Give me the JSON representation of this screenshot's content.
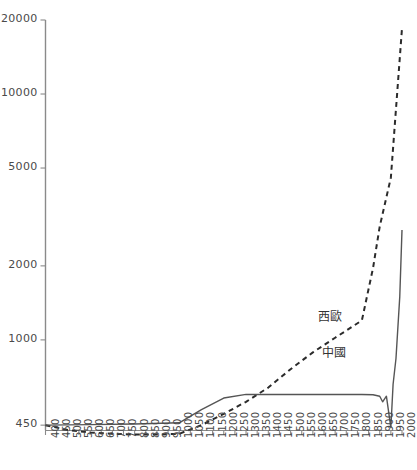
{
  "chart_data": {
    "type": "line",
    "title": "",
    "subtitle": "",
    "xlabel": "",
    "ylabel": "",
    "yscale": "log",
    "xlim": [
      400,
      2000
    ],
    "ylim": [
      430,
      20000
    ],
    "grid": false,
    "legend_position": "inline-annotations",
    "y_ticks": [
      {
        "value": 20000,
        "label": "20000"
      },
      {
        "value": 10000,
        "label": "10000"
      },
      {
        "value": 5000,
        "label": "5000"
      },
      {
        "value": 2000,
        "label": "2000"
      },
      {
        "value": 1000,
        "label": "1000"
      },
      {
        "value": 450,
        "label": "450"
      }
    ],
    "x_ticks": [
      "400",
      "450",
      "500",
      "550",
      "600",
      "650",
      "700",
      "750",
      "800",
      "850",
      "900",
      "950",
      "1000",
      "1050",
      "1100",
      "1150",
      "1200",
      "1250",
      "1300",
      "1350",
      "1400",
      "1450",
      "1500",
      "1550",
      "1600",
      "1650",
      "1700",
      "1750",
      "1800",
      "1850",
      "1900",
      "1950",
      "2000"
    ],
    "series": [
      {
        "name": "西歐",
        "label": "西歐",
        "style": "dashed",
        "color": "#2b2b2b",
        "label_position": {
          "x": 318,
          "y": 307
        },
        "x": [
          400,
          500,
          600,
          700,
          800,
          900,
          1000,
          1100,
          1200,
          1300,
          1400,
          1500,
          1600,
          1700,
          1820,
          1870,
          1900,
          1950,
          2000
        ],
        "values": [
          450,
          430,
          420,
          415,
          412,
          412,
          415,
          450,
          500,
          560,
          640,
          760,
          890,
          1020,
          1200,
          1960,
          2890,
          4570,
          18500
        ]
      },
      {
        "name": "中國",
        "label": "中國",
        "style": "solid",
        "color": "#555555",
        "label_position": {
          "x": 322,
          "y": 343
        },
        "x": [
          400,
          600,
          800,
          1000,
          1100,
          1200,
          1300,
          1400,
          1500,
          1600,
          1700,
          1820,
          1870,
          1900,
          1913,
          1930,
          1950,
          1960,
          1973,
          1990,
          2000
        ],
        "values": [
          450,
          452,
          455,
          460,
          520,
          580,
          600,
          600,
          600,
          600,
          600,
          600,
          598,
          590,
          560,
          590,
          440,
          660,
          840,
          1500,
          2800
        ]
      }
    ]
  }
}
